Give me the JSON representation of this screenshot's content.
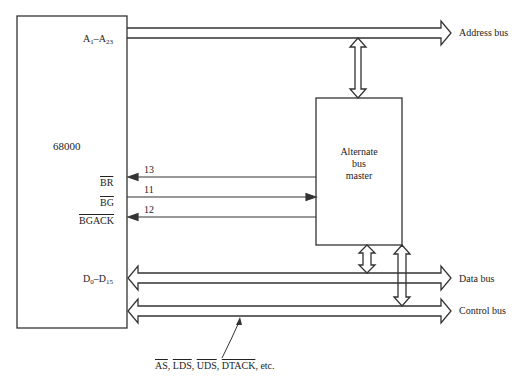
{
  "cpu": {
    "name": "68000",
    "address_pin": {
      "base": "A",
      "from_sub": "1",
      "sep": "–",
      "to_sub": "23"
    },
    "data_pin": {
      "base": "D",
      "from_sub": "0",
      "sep": "–",
      "to_sub": "15"
    },
    "signals": [
      {
        "label": "BR",
        "line_number": "13",
        "direction": "to-cpu"
      },
      {
        "label": "BG",
        "line_number": "11",
        "direction": "to-master"
      },
      {
        "label": "BGACK",
        "line_number": "12",
        "direction": "to-cpu"
      }
    ]
  },
  "alternate_master": {
    "line1": "Alternate",
    "line2": "bus",
    "line3": "master"
  },
  "buses": {
    "address": "Address bus",
    "data": "Data bus",
    "control": "Control bus"
  },
  "control_signals": {
    "items": [
      "AS",
      "LDS",
      "UDS",
      "DTACK"
    ],
    "separator": ", ",
    "suffix": ", etc."
  },
  "colors": {
    "line": "#333333",
    "text": "#222222",
    "background": "#ffffff"
  }
}
